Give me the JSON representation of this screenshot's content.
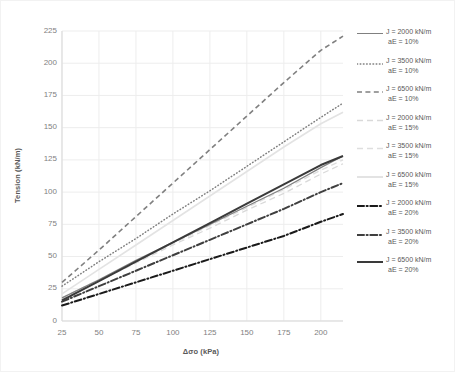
{
  "chart_data": {
    "type": "line",
    "title": "",
    "xlabel": "Δσo (kPa)",
    "ylabel": "Tension (kN/m)",
    "xlim": [
      25,
      215
    ],
    "ylim": [
      0,
      225
    ],
    "xticks": [
      25,
      50,
      75,
      100,
      125,
      150,
      175,
      200
    ],
    "yticks": [
      0,
      25,
      50,
      75,
      100,
      125,
      150,
      175,
      200,
      225
    ],
    "grid": true,
    "legend_position": "right",
    "x": [
      25,
      50,
      75,
      100,
      125,
      150,
      175,
      200,
      215
    ],
    "series": [
      {
        "name": "J = 2000 kN/m  aE = 10%",
        "label_line1": "J = 2000 kN/m",
        "label_line2": "aE = 10%",
        "J": 2000,
        "aE": "10%",
        "style": "solid",
        "color": "#808080",
        "width": 1.3,
        "values": [
          18,
          32,
          47,
          61,
          75,
          89,
          103,
          119,
          128
        ]
      },
      {
        "name": "J = 3500 kN/m  aE = 10%",
        "label_line1": "J = 3500 kN/m",
        "label_line2": "aE = 10%",
        "J": 3500,
        "aE": "10%",
        "style": "dotted",
        "color": "#7f7f7f",
        "width": 1.5,
        "values": [
          27,
          46,
          64,
          83,
          101,
          120,
          139,
          158,
          169
        ]
      },
      {
        "name": "J = 6500 kN/m  aE = 10%",
        "label_line1": "J = 6500 kN/m",
        "label_line2": "aE = 10%",
        "J": 6500,
        "aE": "10%",
        "style": "dashed",
        "color": "#808080",
        "width": 1.6,
        "values": [
          30,
          55,
          81,
          107,
          133,
          159,
          185,
          210,
          221
        ]
      },
      {
        "name": "J = 2000 kN/m  aE = 15%",
        "label_line1": "J = 2000 kN/m",
        "label_line2": "aE = 15%",
        "J": 2000,
        "aE": "15%",
        "style": "dashed-light",
        "color": "#d9d9d9",
        "width": 1.3,
        "values": [
          17,
          31,
          45,
          59,
          72,
          86,
          99,
          114,
          122
        ]
      },
      {
        "name": "J = 3500 kN/m  aE = 15%",
        "label_line1": "J = 3500 kN/m",
        "label_line2": "aE = 15%",
        "J": 3500,
        "aE": "15%",
        "style": "dashed-light",
        "color": "#dedede",
        "width": 1.3,
        "values": [
          18,
          32,
          46,
          60,
          74,
          88,
          102,
          117,
          125
        ]
      },
      {
        "name": "J = 6500 kN/m  aE = 15%",
        "label_line1": "J = 6500 kN/m",
        "label_line2": "aE = 15%",
        "J": 6500,
        "aE": "15%",
        "style": "solid-light",
        "color": "#e3e3e3",
        "width": 1.6,
        "values": [
          21,
          40,
          59,
          78,
          97,
          116,
          135,
          153,
          162
        ]
      },
      {
        "name": "J = 2000 kN/m  aE = 20%",
        "label_line1": "J = 2000 kN/m",
        "label_line2": "aE = 20%",
        "J": 2000,
        "aE": "20%",
        "style": "dashdot",
        "color": "#1a1a1a",
        "width": 2.0,
        "values": [
          12,
          21,
          30,
          39,
          48,
          57,
          66,
          77,
          83
        ]
      },
      {
        "name": "J = 3500 kN/m  aE = 20%",
        "label_line1": "J = 3500 kN/m",
        "label_line2": "aE = 20%",
        "J": 3500,
        "aE": "20%",
        "style": "dashdot",
        "color": "#3f3f3f",
        "width": 2.0,
        "values": [
          15,
          27,
          39,
          51,
          63,
          75,
          87,
          100,
          107
        ]
      },
      {
        "name": "J = 6500 kN/m  aE = 20%",
        "label_line1": "J = 6500 kN/m",
        "label_line2": "aE = 20%",
        "J": 6500,
        "aE": "20%",
        "style": "solid-dark",
        "color": "#3a3a3a",
        "width": 2.0,
        "values": [
          16,
          31,
          46,
          61,
          76,
          91,
          106,
          121,
          128
        ]
      }
    ]
  },
  "axis": {
    "y_title": "Tension (kN/m)",
    "x_title": "Δσo (kPa)",
    "y_ticks": [
      "0",
      "25",
      "50",
      "75",
      "100",
      "125",
      "150",
      "175",
      "200",
      "225"
    ],
    "x_ticks": [
      "25",
      "50",
      "75",
      "100",
      "125",
      "150",
      "175",
      "200"
    ]
  },
  "colors": {
    "grid": "#ededed",
    "axis_line": "#d9d9d9",
    "tick_text": "#7f7f7f",
    "title_text": "#595959",
    "background": "#ffffff",
    "frame": "#f2f2f2"
  }
}
